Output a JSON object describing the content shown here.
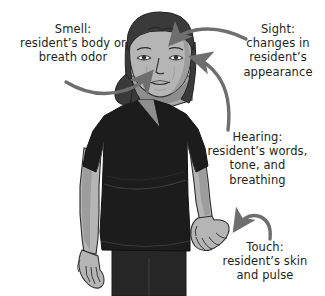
{
  "illustration": {
    "title": "Senses used to observe a resident",
    "subject": "nursing assistant in dark scrubs, standing facing forward",
    "background_color": "#ffffff",
    "arrow_color": "#6e6e6e",
    "text_color": "#231f20",
    "skin_color": "#b5b5b5",
    "hair_color": "#3a3a3a",
    "scrubs_color": "#1c1c1c",
    "outline_color": "#2b2b2b"
  },
  "callouts": [
    {
      "id": "smell",
      "name": "smell-callout",
      "heading": "Smell:",
      "lines": [
        "Smell:",
        "resident’s body or",
        "breath odor"
      ],
      "text": "Smell:\nresident’s body or\nbreath odor",
      "points_to": "nose",
      "arrow_direction": "right"
    },
    {
      "id": "sight",
      "name": "sight-callout",
      "heading": "Sight:",
      "lines": [
        "Sight:",
        "changes in",
        "resident’s",
        "appearance"
      ],
      "text": "Sight:\nchanges in\nresident’s\nappearance",
      "points_to": "top of head",
      "arrow_direction": "left"
    },
    {
      "id": "hearing",
      "name": "hearing-callout",
      "heading": "Hearing:",
      "lines": [
        "Hearing:",
        "resident’s words,",
        "tone, and",
        "breathing"
      ],
      "text": "Hearing:\nresident’s words,\ntone, and\nbreathing",
      "points_to": "ear",
      "arrow_direction": "left"
    },
    {
      "id": "touch",
      "name": "touch-callout",
      "heading": "Touch:",
      "lines": [
        "Touch:",
        "resident’s skin",
        "and pulse"
      ],
      "text": "Touch:\nresident’s skin\nand pulse",
      "points_to": "hand",
      "arrow_direction": "left"
    }
  ]
}
